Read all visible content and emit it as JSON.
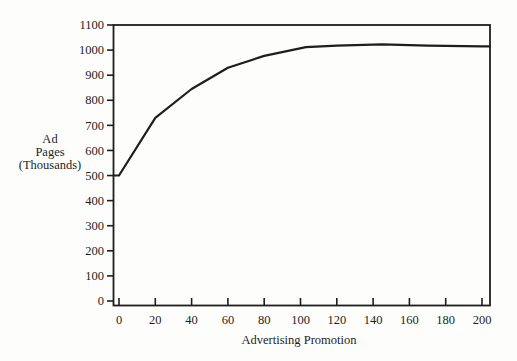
{
  "page": {
    "background": "#fdfdfb",
    "ink": "#1e1e1e"
  },
  "chart_data": {
    "type": "line",
    "title": "",
    "xlabel": "Advertising Promotion",
    "ylabel_lines": [
      "Ad",
      "Pages",
      "(Thousands)"
    ],
    "xlim": [
      0,
      200
    ],
    "ylim": [
      0,
      1100
    ],
    "x_ticks": [
      0,
      20,
      40,
      60,
      80,
      100,
      120,
      140,
      160,
      180,
      200
    ],
    "y_ticks": [
      0,
      100,
      200,
      300,
      400,
      500,
      600,
      700,
      800,
      900,
      1000,
      1100
    ],
    "grid": false,
    "frame": "box",
    "legend": "none",
    "series": [
      {
        "name": "ad-pages",
        "color": "#1e1e1e",
        "points": [
          [
            0,
            500
          ],
          [
            20,
            730
          ],
          [
            40,
            845
          ],
          [
            60,
            930
          ],
          [
            80,
            977
          ],
          [
            103,
            1012
          ],
          [
            120,
            1018
          ],
          [
            145,
            1023
          ],
          [
            170,
            1018
          ],
          [
            200,
            1015
          ]
        ]
      }
    ]
  }
}
